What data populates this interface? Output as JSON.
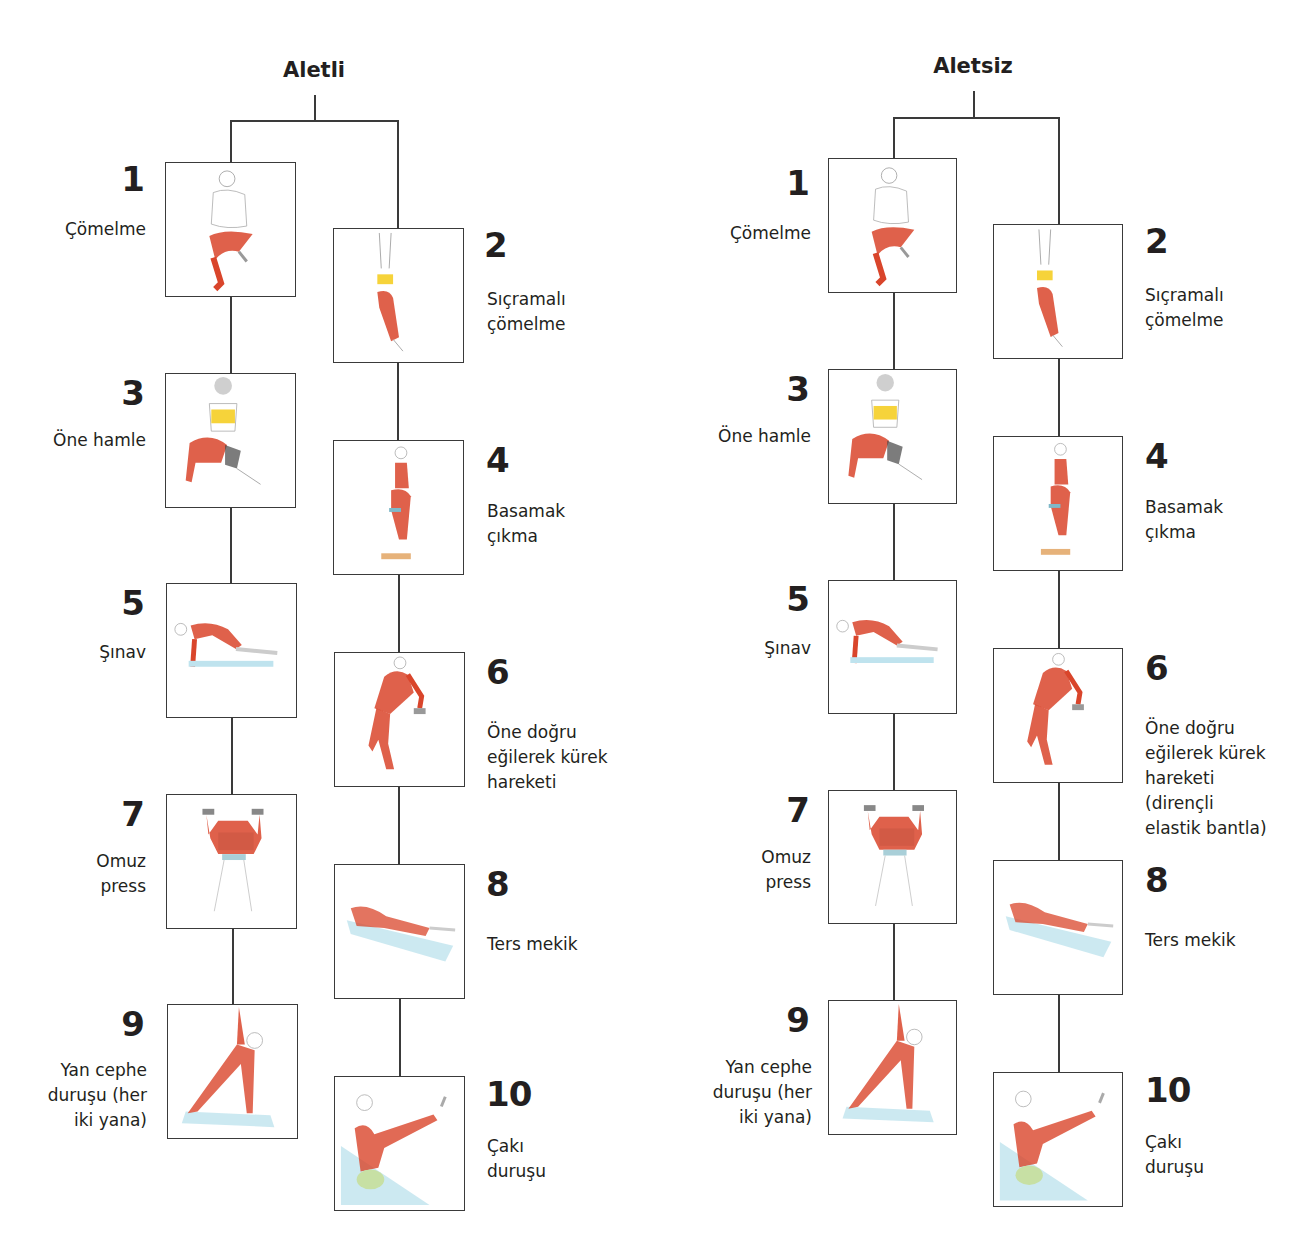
{
  "trees": [
    {
      "title": "Aletli",
      "exercises": [
        {
          "number": "1",
          "label": "Çömelme",
          "icon": "squat-figure-icon"
        },
        {
          "number": "2",
          "label": "Sıçramalı\nçömelme",
          "icon": "jump-squat-figure-icon"
        },
        {
          "number": "3",
          "label": "Öne hamle",
          "icon": "lunge-figure-icon"
        },
        {
          "number": "4",
          "label": "Basamak\nçıkma",
          "icon": "step-up-figure-icon"
        },
        {
          "number": "5",
          "label": "Şınav",
          "icon": "push-up-figure-icon"
        },
        {
          "number": "6",
          "label": "Öne doğru\neğilerek kürek\nhareketi",
          "icon": "bent-over-row-figure-icon"
        },
        {
          "number": "7",
          "label": "Omuz\npress",
          "icon": "shoulder-press-figure-icon"
        },
        {
          "number": "8",
          "label": "Ters mekik",
          "icon": "reverse-crunch-figure-icon"
        },
        {
          "number": "9",
          "label": "Yan cephe\nduruşu (her\niki yana)",
          "icon": "side-plank-figure-icon"
        },
        {
          "number": "10",
          "label": "Çakı\nduruşu",
          "icon": "v-sit-figure-icon"
        }
      ]
    },
    {
      "title": "Aletsiz",
      "exercises": [
        {
          "number": "1",
          "label": "Çömelme",
          "icon": "squat-figure-icon"
        },
        {
          "number": "2",
          "label": "Sıçramalı\nçömelme",
          "icon": "jump-squat-figure-icon"
        },
        {
          "number": "3",
          "label": "Öne hamle",
          "icon": "lunge-figure-icon"
        },
        {
          "number": "4",
          "label": "Basamak\nçıkma",
          "icon": "step-up-figure-icon"
        },
        {
          "number": "5",
          "label": "Şınav",
          "icon": "push-up-figure-icon"
        },
        {
          "number": "6",
          "label": "Öne doğru\neğilerek kürek\nhareketi\n(dirençli\nelastik bantla)",
          "icon": "bent-over-row-figure-icon"
        },
        {
          "number": "7",
          "label": "Omuz\npress",
          "icon": "shoulder-press-figure-icon"
        },
        {
          "number": "8",
          "label": "Ters mekik",
          "icon": "reverse-crunch-figure-icon"
        },
        {
          "number": "9",
          "label": "Yan cephe\nduruşu (her\niki yana)",
          "icon": "side-plank-figure-icon"
        },
        {
          "number": "10",
          "label": "Çakı\nduruşu",
          "icon": "v-sit-figure-icon"
        }
      ]
    }
  ],
  "colors": {
    "line": "#3a3a3a",
    "muscle": "#d9452b",
    "top_accent": "#f6d33a",
    "mat": "#bfe3ee",
    "text": "#231f20"
  }
}
